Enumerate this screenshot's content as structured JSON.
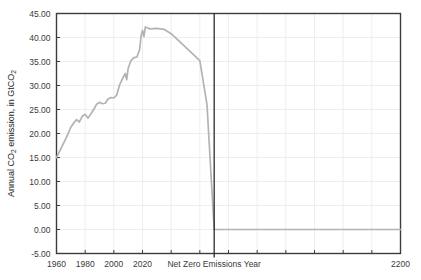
{
  "chart_data": {
    "type": "line",
    "title": "",
    "subtitle": "",
    "xlabel": "",
    "ylabel": "Annual CO2 emission, in GtCO2",
    "ylabel_parts": {
      "lead": "Annual CO",
      "sub1": "2",
      "mid": " emission, in GtCO",
      "sub2": "2"
    },
    "grid": true,
    "legend": "none",
    "xlim": [
      1960,
      2200
    ],
    "ylim": [
      -5,
      45
    ],
    "xticks": [
      1960,
      1980,
      2000,
      2020,
      2200
    ],
    "xtick_labels": [
      "1960",
      "1980",
      "2000",
      "2020",
      "2200"
    ],
    "yticks": [
      -5,
      0,
      5,
      10,
      15,
      20,
      25,
      30,
      35,
      40,
      45
    ],
    "ytick_labels": [
      "-5.00",
      "0.00",
      "5.00",
      "10.00",
      "15.00",
      "20.00",
      "25.00",
      "30.00",
      "35.00",
      "40.00",
      "45.00"
    ],
    "annotations": [
      {
        "name": "net-zero-line",
        "type": "vline",
        "x": 2070,
        "label": "Net Zero Emissions Year",
        "color": "#1a1a1a"
      }
    ],
    "series": [
      {
        "name": "Annual CO2 emission",
        "color": "#b3b3b3",
        "x": [
          1960,
          1962,
          1964,
          1966,
          1968,
          1970,
          1972,
          1974,
          1976,
          1978,
          1980,
          1982,
          1984,
          1986,
          1988,
          1990,
          1992,
          1994,
          1996,
          1998,
          2000,
          2002,
          2004,
          2006,
          2008,
          2009,
          2010,
          2012,
          2014,
          2016,
          2018,
          2019,
          2020,
          2021,
          2022,
          2025,
          2030,
          2035,
          2040,
          2045,
          2050,
          2055,
          2060,
          2065,
          2070,
          2080,
          2100,
          2150,
          2200
        ],
        "y": [
          15.0,
          16.2,
          17.4,
          18.6,
          19.9,
          21.3,
          22.2,
          22.9,
          22.4,
          23.6,
          24.0,
          23.2,
          24.1,
          25.0,
          26.1,
          26.5,
          26.2,
          26.3,
          27.2,
          27.5,
          27.4,
          28.0,
          30.1,
          31.4,
          32.5,
          31.2,
          33.6,
          35.2,
          35.8,
          35.9,
          37.5,
          40.3,
          41.5,
          40.2,
          42.2,
          41.8,
          41.9,
          41.7,
          40.8,
          39.4,
          38.0,
          36.6,
          35.2,
          26.0,
          0.0,
          0.0,
          0.0,
          0.0,
          0.0
        ]
      }
    ]
  },
  "axes": {
    "y_title": "Annual CO2 emission, in GtCO2",
    "net_zero_label": "Net Zero Emissions Year"
  },
  "colors": {
    "line": "#b3b3b3",
    "grid": "#eeeeee",
    "axis": "#3c3c3c",
    "netzero": "#1a1a1a",
    "text": "#3a3a3a",
    "background": "#ffffff"
  }
}
